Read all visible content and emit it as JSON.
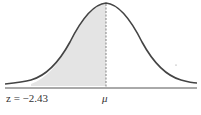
{
  "diagram": {
    "type": "normal-distribution-curve",
    "shaded_region": {
      "from": "z = −2.43",
      "to": "μ"
    },
    "labels": {
      "z_label": "z = −2.43",
      "mean_label": "μ"
    },
    "colors": {
      "curve": "#444444",
      "shade": "#e4e4e4",
      "axis": "#555555"
    }
  }
}
